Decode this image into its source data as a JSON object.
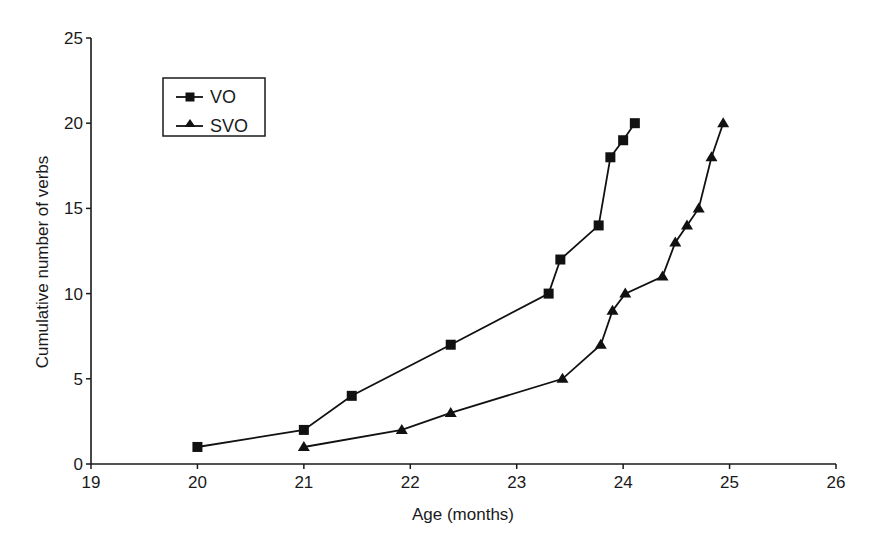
{
  "chart_data": {
    "type": "line",
    "title": "",
    "xlabel": "Age (months)",
    "ylabel": "Cumulative number of verbs",
    "xlim": [
      19,
      26
    ],
    "ylim": [
      0,
      25
    ],
    "xticks": [
      19,
      20,
      21,
      22,
      23,
      24,
      25,
      26
    ],
    "yticks": [
      0,
      5,
      10,
      15,
      20,
      25
    ],
    "grid": false,
    "legend_position": "upper-left (inside)",
    "series": [
      {
        "name": "VO",
        "marker": "square",
        "x": [
          20.0,
          21.0,
          21.45,
          22.38,
          23.3,
          23.41,
          23.77,
          23.88,
          24.0,
          24.11
        ],
        "y": [
          1,
          2,
          4,
          7,
          10,
          12,
          14,
          18,
          19,
          20
        ]
      },
      {
        "name": "SVO",
        "marker": "triangle",
        "x": [
          21.0,
          21.92,
          22.38,
          23.43,
          23.79,
          23.9,
          24.02,
          24.37,
          24.49,
          24.6,
          24.71,
          24.83,
          24.94
        ],
        "y": [
          1,
          2,
          3,
          5,
          7,
          9,
          10,
          11,
          13,
          14,
          15,
          18,
          20
        ]
      }
    ]
  },
  "colors": {
    "ink": "#111111",
    "background": "#ffffff"
  }
}
